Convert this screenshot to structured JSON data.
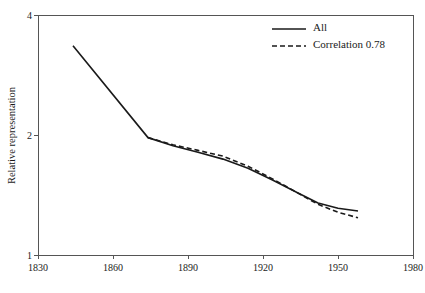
{
  "chart_data": {
    "type": "line",
    "title": "",
    "xlabel": "",
    "ylabel": "Relative representation",
    "xlim": [
      1830,
      1980
    ],
    "ylim": [
      1,
      4
    ],
    "yscale": "log",
    "grid": false,
    "xticks": [
      1830,
      1860,
      1890,
      1920,
      1950,
      1980
    ],
    "xtick_labels": [
      "1830",
      "1860",
      "1890",
      "1920",
      "1950",
      "1980"
    ],
    "yticks": [
      1,
      2,
      4
    ],
    "ytick_labels": [
      "1",
      "2",
      "4"
    ],
    "legend_position": "top-right",
    "series": [
      {
        "name": "All",
        "style": "solid",
        "color": "#1a1a1a",
        "x": [
          1844,
          1874,
          1884,
          1894,
          1904,
          1914,
          1924,
          1934,
          1942,
          1950,
          1958
        ],
        "y": [
          3.35,
          1.97,
          1.88,
          1.81,
          1.74,
          1.65,
          1.54,
          1.43,
          1.35,
          1.31,
          1.29
        ]
      },
      {
        "name": "Correlation 0.78",
        "style": "dashed",
        "color": "#1a1a1a",
        "x": [
          1874,
          1884,
          1894,
          1904,
          1914,
          1924,
          1934,
          1942,
          1950,
          1958
        ],
        "y": [
          1.97,
          1.89,
          1.83,
          1.77,
          1.67,
          1.55,
          1.43,
          1.34,
          1.28,
          1.24
        ]
      }
    ]
  },
  "legend": {
    "items": [
      {
        "label": "All",
        "style": "solid"
      },
      {
        "label": "Correlation 0.78",
        "style": "dashed"
      }
    ]
  }
}
